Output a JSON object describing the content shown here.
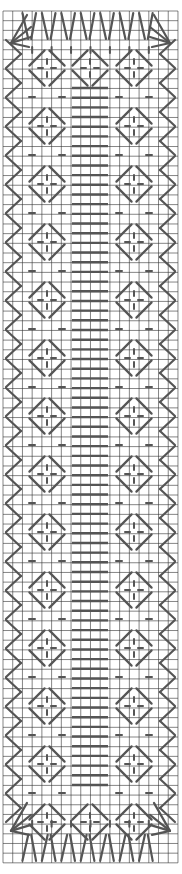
{
  "pattern": {
    "type": "stitch-chart",
    "grid": {
      "cols": 18,
      "rows": 88,
      "origin_x": 3,
      "origin_y": 11,
      "cell_w": 9.72,
      "cell_h": 9.68,
      "line_color": "#333333"
    },
    "stitch_color": "#555555",
    "background": "#ffffff",
    "motifs": {
      "border_left": "zigzag-right-pointing",
      "border_right": "zigzag-left-pointing",
      "diamond_columns_x": [
        47,
        134
      ],
      "center_column_x": 90,
      "diamond_half": 20,
      "diamond_period_y": 58,
      "diamond_first_y": 68,
      "diamond_count": 14,
      "zigzag_period_y": 29,
      "center_bars": {
        "x1": 72,
        "x2": 108,
        "y_start": 88,
        "y_end": 786
      },
      "top_fan_y": 12,
      "bottom_fan_y": 862
    }
  }
}
